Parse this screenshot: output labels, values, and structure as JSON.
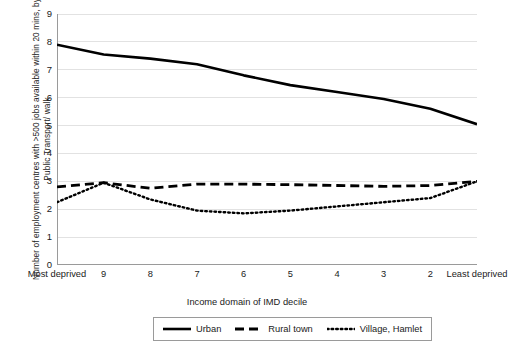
{
  "chart_data": {
    "type": "line",
    "title": "",
    "xlabel": "Income domain of IMD decile",
    "ylabel": "Number of employment centres with >500 jobs available within 20 mins, by Public Transport/ walk",
    "categories": [
      "Most deprived",
      "9",
      "8",
      "7",
      "6",
      "5",
      "4",
      "3",
      "2",
      "Least deprived"
    ],
    "ylim": [
      0,
      9
    ],
    "y_ticks": [
      0,
      1,
      2,
      3,
      4,
      5,
      6,
      7,
      8,
      9
    ],
    "grid": "horizontal",
    "legend_position": "bottom",
    "series": [
      {
        "name": "Urban",
        "style": "solid",
        "color": "#000000",
        "values": [
          7.9,
          7.55,
          7.4,
          7.2,
          6.8,
          6.45,
          6.2,
          5.95,
          5.6,
          5.05
        ]
      },
      {
        "name": "Rural town",
        "style": "dashed",
        "color": "#000000",
        "values": [
          2.8,
          2.95,
          2.75,
          2.9,
          2.9,
          2.88,
          2.85,
          2.82,
          2.85,
          3.0
        ]
      },
      {
        "name": "Village, Hamlet",
        "style": "dotted",
        "color": "#000000",
        "values": [
          2.25,
          2.95,
          2.35,
          1.95,
          1.85,
          1.95,
          2.1,
          2.25,
          2.4,
          3.0
        ]
      }
    ]
  },
  "axes": {
    "y_title": "Number of employment centres with >500 jobs available within 20 mins, by Public Transport/ walk",
    "x_title": "Income domain of IMD decile"
  },
  "legend": {
    "items": [
      {
        "label": "Urban",
        "style": "solid"
      },
      {
        "label": "Rural town",
        "style": "dashed"
      },
      {
        "label": "Village, Hamlet",
        "style": "dotted"
      }
    ]
  },
  "colors": {
    "line": "#000000",
    "grid": "#e2e2e2",
    "axis": "#9a9a9a",
    "text": "#1a1a1a",
    "background": "#ffffff"
  }
}
